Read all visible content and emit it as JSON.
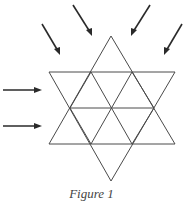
{
  "figure": {
    "caption": "Figure 1",
    "colors": {
      "lines": "#4a4a4a",
      "arrows": "#2a2a2a"
    },
    "grid": {
      "shape": "hexagram",
      "rows_of_triangles": 4,
      "horizontal_lines": 3
    },
    "arrows": [
      {
        "id": "arrow-top-left-outer",
        "direction": "down-right"
      },
      {
        "id": "arrow-top-left-inner",
        "direction": "down-right"
      },
      {
        "id": "arrow-top-right-inner",
        "direction": "down-left"
      },
      {
        "id": "arrow-top-right-outer",
        "direction": "down-left"
      },
      {
        "id": "arrow-left-upper",
        "direction": "right"
      },
      {
        "id": "arrow-left-lower",
        "direction": "right"
      }
    ]
  }
}
